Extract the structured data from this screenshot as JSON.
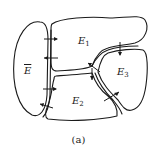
{
  "figure": {
    "caption": "(a)",
    "regions": [
      {
        "id": "E_bar",
        "label": "E",
        "overline": true
      },
      {
        "id": "E1",
        "label": "E",
        "subscript": "1"
      },
      {
        "id": "E2",
        "label": "E",
        "subscript": "2"
      },
      {
        "id": "E3",
        "label": "E",
        "subscript": "3"
      }
    ],
    "boundary_arrows": [
      {
        "between": [
          "E_bar",
          "E1"
        ],
        "direction": "into E1"
      },
      {
        "between": [
          "E1",
          "E_bar"
        ],
        "direction": "into E_bar"
      },
      {
        "between": [
          "E_bar",
          "E2"
        ],
        "direction": "into E2"
      },
      {
        "between": [
          "E2",
          "E_bar"
        ],
        "direction": "into E_bar"
      },
      {
        "between": [
          "E1",
          "E3"
        ],
        "direction": "into E1"
      },
      {
        "between": [
          "E2",
          "E1"
        ],
        "direction": "into E2"
      },
      {
        "between": [
          "E1",
          "E3"
        ],
        "direction": "into E3 (top)"
      },
      {
        "between": [
          "E2",
          "E3"
        ],
        "direction": "into E3"
      }
    ]
  }
}
